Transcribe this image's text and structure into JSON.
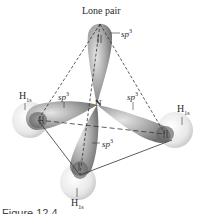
{
  "diagram": {
    "title": "Lone pair",
    "central_atom": "N",
    "orbital_labels": {
      "top": "sp",
      "left": "sp",
      "right": "sp",
      "bottom": "sp",
      "superscript": "3"
    },
    "hydrogen_labels": {
      "left": "H",
      "right": "H",
      "bottom": "H",
      "subscript": "1s"
    },
    "caption": "Figure 12.4"
  }
}
